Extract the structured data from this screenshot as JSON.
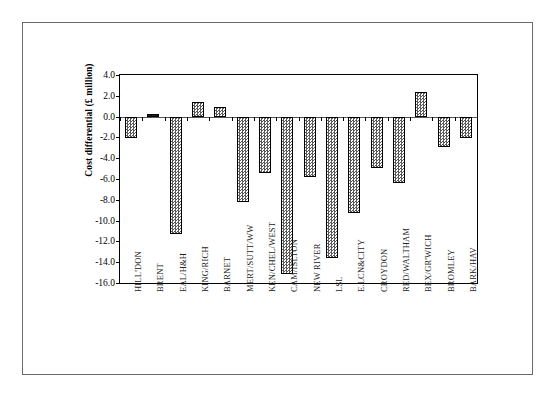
{
  "chart_data": {
    "type": "bar",
    "title": "",
    "subtitle": "",
    "xlabel": "",
    "ylabel": "Cost differential (£ million)",
    "ylim": [
      -16.0,
      4.0
    ],
    "ytick_labels": [
      "4.0",
      "2.0",
      "0.0",
      "-2.0",
      "-4.0",
      "-6.0",
      "-8.0",
      "-10.0",
      "-12.0",
      "-14.0",
      "-16.0"
    ],
    "yticks": [
      4.0,
      2.0,
      0.0,
      -2.0,
      -4.0,
      -6.0,
      -8.0,
      -10.0,
      -12.0,
      -14.0,
      -16.0
    ],
    "grid": false,
    "legend": "none",
    "categories": [
      "HILL'DON",
      "BRENT",
      "EAL/H&H",
      "KING/RICH",
      "BARNET",
      "MERT/SUTT/WW",
      "KEN/CHEL/WEST",
      "CAM/ISLTON",
      "NEW RIVER",
      "LSL",
      "E.LCN&CITY",
      "CROYDON",
      "RED/WALTHAM",
      "BEX/GR'WICH",
      "BROMLEY",
      "BARK/HAV"
    ],
    "values": [
      -2.1,
      0.2,
      -11.3,
      1.4,
      0.9,
      -8.2,
      -5.4,
      -15.1,
      -5.8,
      -13.6,
      -9.3,
      -4.9,
      -6.4,
      2.4,
      -2.9,
      -2.1
    ]
  }
}
